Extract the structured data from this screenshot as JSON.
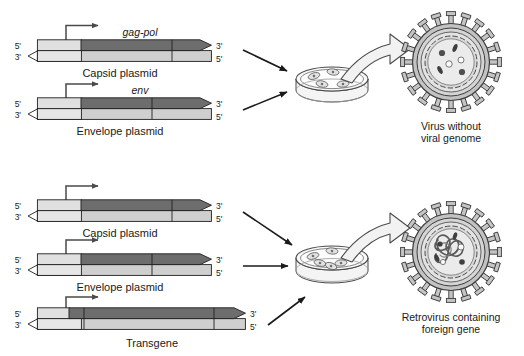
{
  "figure": {
    "background_color": "#ffffff"
  },
  "palette": {
    "outline": "#231f20",
    "strand_light": "#e3e3e3",
    "strand_mid": "#c9c9c9",
    "gene_dark": "#6d6d6d",
    "gene_darker": "#595959",
    "fill_white": "#ffffff",
    "virus_grey": "#b9b9b9",
    "virus_light": "#d8d8d8",
    "dish_grey": "#efefef",
    "arrow_black": "#1a1a1a"
  },
  "panels": [
    {
      "id": "top-panel",
      "name": "virus-without-genome-panel",
      "constructs": [
        {
          "id": "capsid-plasmid-top",
          "caption": "Capsid plasmid",
          "gene_label": "gag-pol",
          "end_labels": {
            "left_top": "5'",
            "left_bottom": "3'",
            "right_top": "3'",
            "right_bottom": "5'"
          },
          "has_promoter_arrow": true
        },
        {
          "id": "envelope-plasmid-top",
          "caption": "Envelope plasmid",
          "gene_label": "env",
          "end_labels": {
            "left_top": "5'",
            "left_bottom": "3'",
            "right_top": "3'",
            "right_bottom": "5'"
          },
          "has_promoter_arrow": true
        }
      ],
      "dish": {
        "name": "petri-dish-top",
        "cell_count": 5
      },
      "product": {
        "name": "virus-particle-empty",
        "caption_line1": "Virus without",
        "caption_line2": "viral genome",
        "contains_genome": false,
        "spike_count": 20
      },
      "arrow_count_to_dish": 2
    },
    {
      "id": "bottom-panel",
      "name": "retrovirus-with-transgene-panel",
      "constructs": [
        {
          "id": "capsid-plasmid-bottom",
          "caption": "Capsid plasmid",
          "gene_label": "",
          "end_labels": {
            "left_top": "5'",
            "left_bottom": "3'",
            "right_top": "3'",
            "right_bottom": "5'"
          },
          "has_promoter_arrow": true
        },
        {
          "id": "envelope-plasmid-bottom",
          "caption": "Envelope plasmid",
          "gene_label": "",
          "end_labels": {
            "left_top": "5'",
            "left_bottom": "3'",
            "right_top": "3'",
            "right_bottom": "5'"
          },
          "has_promoter_arrow": true
        },
        {
          "id": "transgene-construct",
          "caption": "Transgene",
          "gene_label": "",
          "end_labels": {
            "left_top": "5'",
            "left_bottom": "3'",
            "right_top": "3'",
            "right_bottom": "5'"
          },
          "has_promoter_arrow": true
        }
      ],
      "dish": {
        "name": "petri-dish-bottom",
        "cell_count": 6
      },
      "product": {
        "name": "virus-particle-loaded",
        "caption_line1": "Retrovirus containing",
        "caption_line2": "foreign gene",
        "contains_genome": true,
        "spike_count": 20
      },
      "arrow_count_to_dish": 3
    }
  ]
}
